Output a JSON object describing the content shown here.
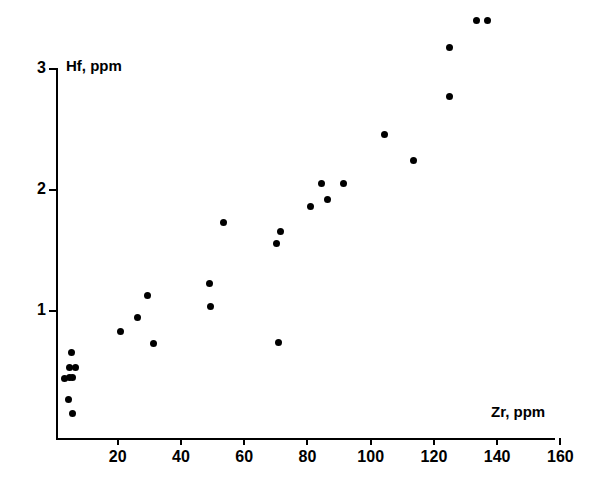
{
  "chart_data": {
    "type": "scatter",
    "title": "",
    "xlabel": "Zr, ppm",
    "ylabel": "Hf, ppm",
    "xlim": [
      0,
      160
    ],
    "ylim": [
      0,
      3.2
    ],
    "xticks": [
      20,
      40,
      60,
      80,
      100,
      120,
      140,
      160
    ],
    "yticks": [
      1,
      2,
      3
    ],
    "xtick_labels": [
      "20",
      "40",
      "60",
      "80",
      "100",
      "120",
      "140",
      "160"
    ],
    "ytick_labels": [
      "1",
      "2",
      "3"
    ],
    "grid": false,
    "legend": null,
    "marker": "filled-circle",
    "marker_color": "#000000",
    "axis_color": "#000000",
    "background_color": "#ffffff",
    "points": [
      {
        "x": 3.3,
        "y": 0.44
      },
      {
        "x": 4.6,
        "y": 0.45
      },
      {
        "x": 5.8,
        "y": 0.45
      },
      {
        "x": 4.3,
        "y": 0.27
      },
      {
        "x": 4.9,
        "y": 0.53
      },
      {
        "x": 6.5,
        "y": 0.53
      },
      {
        "x": 5.5,
        "y": 0.66
      },
      {
        "x": 5.8,
        "y": 0.15
      },
      {
        "x": 21.0,
        "y": 0.83
      },
      {
        "x": 26.4,
        "y": 0.95
      },
      {
        "x": 29.3,
        "y": 1.13
      },
      {
        "x": 31.2,
        "y": 0.73
      },
      {
        "x": 49.0,
        "y": 1.23
      },
      {
        "x": 49.4,
        "y": 1.04
      },
      {
        "x": 53.4,
        "y": 1.73
      },
      {
        "x": 70.8,
        "y": 0.74
      },
      {
        "x": 70.1,
        "y": 1.56
      },
      {
        "x": 71.4,
        "y": 1.66
      },
      {
        "x": 81.0,
        "y": 1.86
      },
      {
        "x": 84.4,
        "y": 2.05
      },
      {
        "x": 86.2,
        "y": 1.92
      },
      {
        "x": 91.4,
        "y": 2.05
      },
      {
        "x": 104.3,
        "y": 2.46
      },
      {
        "x": 113.4,
        "y": 2.24
      },
      {
        "x": 124.8,
        "y": 2.77
      },
      {
        "x": 124.8,
        "y": 3.18
      },
      {
        "x": 133.4,
        "y": 3.4
      },
      {
        "x": 136.9,
        "y": 3.4
      }
    ]
  }
}
